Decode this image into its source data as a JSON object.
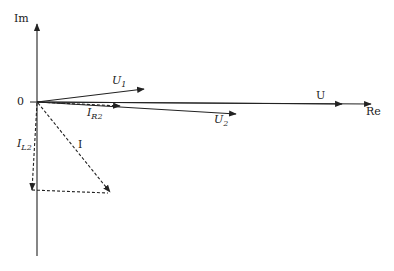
{
  "diagram": {
    "type": "phasor-diagram",
    "colors": {
      "line": "#222222",
      "background": "#ffffff"
    },
    "axes": {
      "imaginary": {
        "label": "Im"
      },
      "real": {
        "label": "Re"
      },
      "origin_label": "0"
    },
    "phasors": [
      {
        "id": "U",
        "label": "U",
        "subscript": "",
        "style": "solid"
      },
      {
        "id": "U1",
        "label": "U",
        "subscript": "1",
        "style": "solid"
      },
      {
        "id": "U2",
        "label": "U",
        "subscript": "2",
        "style": "solid"
      },
      {
        "id": "IR2",
        "label": "I",
        "subscript": "R2",
        "style": "dashed"
      },
      {
        "id": "IL2",
        "label": "I",
        "subscript": "L2",
        "style": "dashed"
      },
      {
        "id": "I",
        "label": "I",
        "subscript": "",
        "style": "dashed"
      }
    ]
  }
}
